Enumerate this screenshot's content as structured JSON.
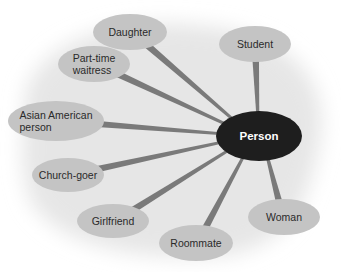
{
  "diagram": {
    "type": "concept-map",
    "center": {
      "id": "person",
      "label": "Person",
      "cx": 259,
      "cy": 136,
      "rx": 43,
      "ry": 25
    },
    "nodes": [
      {
        "id": "daughter",
        "label": "Daughter",
        "cx": 130,
        "cy": 32,
        "rx": 37,
        "ry": 18
      },
      {
        "id": "student",
        "label": "Student",
        "cx": 255,
        "cy": 44,
        "rx": 36,
        "ry": 18
      },
      {
        "id": "part-time-waitress",
        "label": "Part-time\nwaitress",
        "cx": 94,
        "cy": 64,
        "rx": 36,
        "ry": 18
      },
      {
        "id": "asian-american-person",
        "label": "Asian American\nperson",
        "cx": 56,
        "cy": 121,
        "rx": 48,
        "ry": 20
      },
      {
        "id": "church-goer",
        "label": "Church-goer",
        "cx": 68,
        "cy": 175,
        "rx": 36,
        "ry": 17
      },
      {
        "id": "girlfriend",
        "label": "Girlfriend",
        "cx": 113,
        "cy": 221,
        "rx": 36,
        "ry": 17
      },
      {
        "id": "roommate",
        "label": "Roommate",
        "cx": 196,
        "cy": 243,
        "rx": 37,
        "ry": 18
      },
      {
        "id": "woman",
        "label": "Woman",
        "cx": 284,
        "cy": 217,
        "rx": 36,
        "ry": 18
      }
    ],
    "colors": {
      "center_fill": "#1e1e1e",
      "leaf_fill": "#c4c4c4",
      "connector": "#7a7a7a",
      "shadow": "#e4e4e4",
      "text": "#2a2a2a",
      "center_text": "#ffffff"
    }
  }
}
